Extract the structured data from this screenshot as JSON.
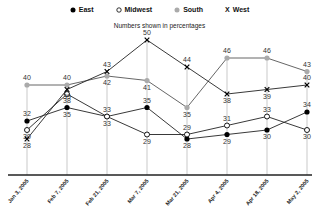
{
  "chart_data": {
    "type": "line",
    "title": "",
    "subtitle": "Numbers shown in percentages",
    "xlabel": "",
    "ylabel": "",
    "categories": [
      "Jan 3, 2005",
      "Feb 7, 2005",
      "Feb 21, 2005",
      "Mar 7, 2005",
      "Mar 21, 2005",
      "Apr 4, 2005",
      "Apr 18, 2005",
      "May 2, 2005"
    ],
    "series": [
      {
        "name": "East",
        "marker": "filled-circle",
        "color": "#000000",
        "values": [
          32,
          35,
          33,
          35,
          28,
          29,
          30,
          34
        ]
      },
      {
        "name": "Midwest",
        "marker": "open-circle",
        "color": "#000000",
        "values": [
          30,
          38,
          33,
          29,
          29,
          31,
          33,
          30
        ]
      },
      {
        "name": "South",
        "marker": "gray-dot",
        "color": "#aaaaaa",
        "values": [
          40,
          40,
          42,
          41,
          35,
          46,
          46,
          43
        ]
      },
      {
        "name": "West",
        "marker": "x",
        "color": "#000000",
        "values": [
          28,
          39,
          43,
          50,
          44,
          38,
          39,
          40
        ]
      }
    ],
    "ylim": [
      25,
      52
    ],
    "grid": "vertical-lines",
    "legend_position": "top"
  },
  "legend": {
    "items": [
      {
        "label": "East"
      },
      {
        "label": "Midwest"
      },
      {
        "label": "South"
      },
      {
        "label": "West"
      }
    ]
  }
}
